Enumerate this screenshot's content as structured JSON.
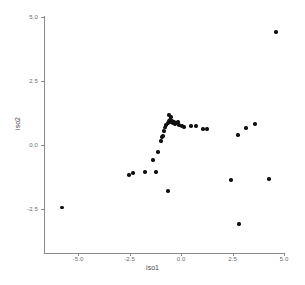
{
  "chart_data": {
    "type": "scatter",
    "title": "",
    "xlabel": "iso1",
    "ylabel": "iso2",
    "xlim": [
      -6.6,
      5.0
    ],
    "ylim": [
      -3.5,
      5.0
    ],
    "xticks": [
      -5.0,
      -2.5,
      0.0,
      2.5,
      5.0
    ],
    "yticks": [
      -2.5,
      0.0,
      2.5,
      5.0
    ],
    "xtick_labels": [
      "-5.0",
      "-2.5",
      "0.0",
      "2.5",
      "5.0"
    ],
    "ytick_labels": [
      "-2.5",
      "0.0",
      "2.5",
      "5.0"
    ],
    "grid": false,
    "legend": null,
    "marker": "circle",
    "marker_color": "#111111",
    "axis_color": "#8a8a8a",
    "background_color": "#ffffff",
    "n_points": 38,
    "points": [
      {
        "x": 4.61,
        "y": 4.41
      },
      {
        "x": -5.78,
        "y": -2.44
      },
      {
        "x": -2.53,
        "y": -1.17
      },
      {
        "x": -2.33,
        "y": -1.09
      },
      {
        "x": -1.75,
        "y": -1.05
      },
      {
        "x": -1.21,
        "y": -1.05
      },
      {
        "x": -1.36,
        "y": -0.59
      },
      {
        "x": -1.12,
        "y": -0.27
      },
      {
        "x": -0.97,
        "y": 0.16
      },
      {
        "x": -0.92,
        "y": 0.31
      },
      {
        "x": -0.87,
        "y": 0.35
      },
      {
        "x": -0.83,
        "y": 0.55
      },
      {
        "x": -0.78,
        "y": 0.68
      },
      {
        "x": -0.73,
        "y": 0.78
      },
      {
        "x": -0.63,
        "y": 0.86
      },
      {
        "x": -0.58,
        "y": 0.94
      },
      {
        "x": -0.53,
        "y": 0.98
      },
      {
        "x": -0.49,
        "y": 0.9
      },
      {
        "x": -0.44,
        "y": 0.94
      },
      {
        "x": -0.39,
        "y": 0.86
      },
      {
        "x": -0.34,
        "y": 0.9
      },
      {
        "x": -0.29,
        "y": 0.82
      },
      {
        "x": -0.24,
        "y": 0.86
      },
      {
        "x": -0.58,
        "y": 1.17
      },
      {
        "x": -0.49,
        "y": 1.09
      },
      {
        "x": -0.15,
        "y": 0.9
      },
      {
        "x": -0.1,
        "y": 0.78
      },
      {
        "x": 0.05,
        "y": 0.74
      },
      {
        "x": 0.15,
        "y": 0.7
      },
      {
        "x": 0.49,
        "y": 0.74
      },
      {
        "x": 0.73,
        "y": 0.74
      },
      {
        "x": 1.07,
        "y": 0.63
      },
      {
        "x": 1.26,
        "y": 0.63
      },
      {
        "x": 2.77,
        "y": 0.39
      },
      {
        "x": 3.16,
        "y": 0.66
      },
      {
        "x": 3.59,
        "y": 0.82
      },
      {
        "x": 2.43,
        "y": -1.37
      },
      {
        "x": 4.27,
        "y": -1.33
      },
      {
        "x": -0.63,
        "y": -1.8
      },
      {
        "x": 2.82,
        "y": -3.09
      }
    ]
  },
  "axes": {
    "x_title": "iso1",
    "y_title": "iso2"
  }
}
